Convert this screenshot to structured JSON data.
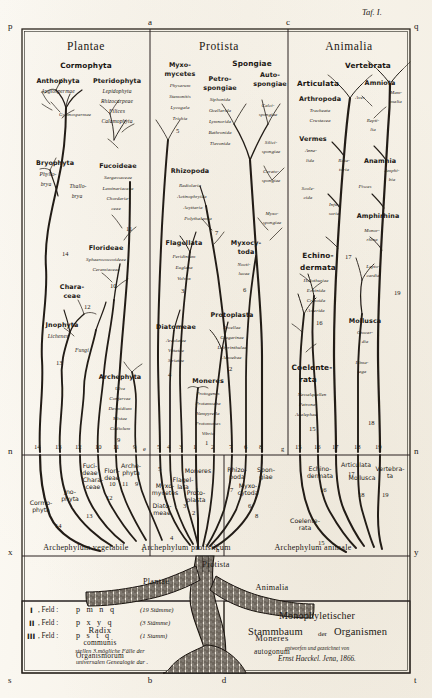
{
  "plate": {
    "taf_label": "Taf. I.",
    "corner_letters": {
      "top_left": "p",
      "top_a": "a",
      "top_c": "c",
      "top_right": "q",
      "mid_left": "n",
      "mid_right": "n",
      "low_left": "x",
      "low_right": "y",
      "bottom_left": "s",
      "bottom_mid": "b",
      "bottom_d": "d",
      "bottom_right": "t",
      "base_e": "e",
      "base_g": "g",
      "base_f": "f",
      "base_h": "h"
    }
  },
  "kingdoms": [
    {
      "name": "Plantae",
      "phylum_line": "Archephylum vegetabile"
    },
    {
      "name": "Protista",
      "phylum_line": "Archephylum protisticum"
    },
    {
      "name": "Animalia",
      "phylum_line": "Archephylum animale"
    }
  ],
  "plantae": {
    "top_header": "Cormophyta",
    "groups": [
      {
        "name": "Anthophyta",
        "subs": [
          "Angiospermae",
          "Gymnospermae"
        ],
        "number": ""
      },
      {
        "name": "Pteridophyta",
        "subs": [
          "Lepidophyta",
          "Rhizocarpeae",
          "Filices",
          "Calamophyta"
        ],
        "number": ""
      },
      {
        "name": "Bryophyta",
        "subs": [
          "Phyllo-",
          "bryа",
          "Thallo-",
          "bryа"
        ],
        "number": "14"
      },
      {
        "name": "Fucoideae",
        "subs": [
          "Sargassaceae",
          "Laminariaceae",
          "Chordaria-",
          "ceae"
        ],
        "number": "11"
      },
      {
        "name": "Florideae",
        "subs": [
          "Sphaerococcoideae",
          "Ceramiaceae"
        ],
        "number": "10"
      },
      {
        "name": "Chara-",
        "name2": "ceae",
        "subs": [],
        "number": "12"
      },
      {
        "name": "Jnophyta",
        "subs": [
          "Lichenes",
          "Fungi"
        ],
        "number": "13"
      },
      {
        "name": "Archephyta",
        "subs": [
          "Ulva",
          "Confervae",
          "Desmidium",
          "Mistae",
          "Codiolum"
        ],
        "number": "9"
      }
    ]
  },
  "protista": {
    "groups": [
      {
        "name": "Myxo-",
        "name2": "mycetes",
        "subs": [
          "Physarum",
          "Stemonitis",
          "Lycogala",
          "Trichia"
        ],
        "number": "5"
      },
      {
        "name": "Spongiae",
        "subs": [],
        "number": ""
      },
      {
        "name": "Petro-",
        "name2": "spongiae",
        "subs": [
          "Siphonida",
          "Ocellarida",
          "Lymnorida",
          "Bathronida",
          "Tlavonida"
        ],
        "number": ""
      },
      {
        "name": "Auto-",
        "name2": "spongiae",
        "subs": [
          "Calci-",
          "spongiae",
          "Silici-",
          "spongiae",
          "Cerato-",
          "spongiae",
          "Myxo-",
          "spongiae"
        ],
        "number": ""
      },
      {
        "name": "Rhizopoda",
        "subs": [
          "Radiolaria",
          "Actinophryida",
          "Acyttaria",
          "Polythalamia"
        ],
        "number": "7"
      },
      {
        "name": "Flagellata",
        "subs": [
          "Peridinium",
          "Euglena",
          "Volvox"
        ],
        "number": "3"
      },
      {
        "name": "Myxocy-",
        "name2": "toda",
        "subs": [
          "Nocti-",
          "lucae"
        ],
        "number": "6"
      },
      {
        "name": "Diatomeae",
        "subs": [
          "Areolatae",
          "Vittatae",
          "Striatae"
        ],
        "number": "4"
      },
      {
        "name": "Protoplasta",
        "subs": [
          "Arcellae",
          "Gregarinae",
          "Labyrinthulae",
          "Amoebae"
        ],
        "number": "2"
      },
      {
        "name": "Moneres",
        "subs": [
          "Protogenes",
          "Protamoeba",
          "Vampyrella",
          "Protomonas",
          "Vibrio"
        ],
        "number": "1"
      }
    ]
  },
  "animalia": {
    "top_header": "Vertebrata",
    "groups": [
      {
        "name": "Articulata",
        "subs": [],
        "number": ""
      },
      {
        "name": "Arthropoda",
        "subs": [
          "Tracheata",
          "Crustacea"
        ],
        "number": ""
      },
      {
        "name": "Vermes",
        "subs": [
          "Anne-",
          "lida"
        ],
        "number": ""
      },
      {
        "name": "Rota-",
        "name2": "toria",
        "subs": [],
        "number": ""
      },
      {
        "name": "Scole-",
        "name2": "cida",
        "subs": [],
        "number": ""
      },
      {
        "name": "Infu-",
        "name2": "soria",
        "subs": [],
        "number": ""
      },
      {
        "name": "Amniota",
        "subs": [
          "Aves",
          "Mam-",
          "malia",
          "Repti-",
          "lia"
        ],
        "number": ""
      },
      {
        "name": "Anamnia",
        "subs": [
          "Amphi-",
          "bia",
          "Pisces"
        ],
        "number": ""
      },
      {
        "name": "Amphirhina",
        "subs": [
          "Monor-",
          "rhina",
          "Lepto-",
          "cardia"
        ],
        "number": "19"
      },
      {
        "name": "Echino-",
        "name2": "dermata",
        "subs": [
          "Holothuriae",
          "Echinida",
          "Crinoida",
          "Asterida"
        ],
        "number": "16"
      },
      {
        "name": "Mollusca",
        "subs": [
          "Otocar-",
          "dia",
          "Hima-",
          "tega"
        ],
        "number": "18"
      },
      {
        "name": "Coelente-",
        "name2": "rata",
        "subs": [
          "Nesselquallen",
          "Petrona-",
          "Acalephae"
        ],
        "number": "15"
      },
      {
        "name": "mark17",
        "subs": [],
        "number": "17"
      }
    ]
  },
  "baseline_numbers": {
    "left": [
      "14",
      "13",
      "12",
      "10",
      "11",
      "9"
    ],
    "mid": [
      "5",
      "3",
      "4",
      "1",
      "2",
      "7",
      "6",
      "8"
    ],
    "right": [
      "15",
      "16",
      "17",
      "18",
      "19"
    ]
  },
  "baseline_names": {
    "plantae": [
      {
        "label": "Cormo-\nphyta",
        "num": "14"
      },
      {
        "label": "Jno-\nphyta",
        "num": "13"
      },
      {
        "label": "Chara-\nceae",
        "num": "12"
      },
      {
        "label": "Flori-\ndeae",
        "num": "10"
      },
      {
        "label": "Fuci-\ndeae",
        "num": "11"
      },
      {
        "label": "Arche-\nphyta",
        "num": "9"
      }
    ],
    "protista": [
      {
        "label": "Diato-\nmeae",
        "num": "4"
      },
      {
        "label": "Flagel-\nlata",
        "num": "3"
      },
      {
        "label": "Myxo-\nmycetes",
        "num": "5"
      },
      {
        "label": "Moneres",
        "num": "1"
      },
      {
        "label": "Proto-\nplasta",
        "num": "2"
      },
      {
        "label": "Rhizo-\npoda",
        "num": "7"
      },
      {
        "label": "Myxo-\ncytoda",
        "num": "6"
      },
      {
        "label": "Spon-\ngiae",
        "num": "8"
      }
    ],
    "animalia": [
      {
        "label": "Coelente-\nrata",
        "num": "15"
      },
      {
        "label": "Echino-\ndermata",
        "num": "16"
      },
      {
        "label": "Articulata",
        "num": "17"
      },
      {
        "label": "Mollusca",
        "num": "18"
      },
      {
        "label": "Vertebra-\nta",
        "num": "19"
      }
    ]
  },
  "root": {
    "plantae_label": "Plantae",
    "protista_label": "Protista",
    "animalia_label": "Animalia",
    "radix_line1": "Radix",
    "radix_line2": "communis",
    "radix_line3": "Organismorum",
    "moneres_line1": "Moneres",
    "moneres_line2": "autogonum"
  },
  "legend": {
    "rows": [
      {
        "roman": "I",
        "feld": ", Feld :",
        "letters": "p m n q",
        "note": "(19 Stämme)"
      },
      {
        "roman": "II",
        "feld": ", Feld :",
        "letters": "p x y q",
        "note": "(3 Stämme)"
      },
      {
        "roman": "III",
        "feld": ", Feld :",
        "letters": "p s t q",
        "note": "(1 Stamm)"
      }
    ],
    "footer1": "stellen 3 mögliche Fälle der",
    "footer2": "universalen Genealogie dar ."
  },
  "title_block": {
    "line1": "Monophyletischer",
    "line2a": "Stammbaum",
    "line2b": "der",
    "line2c": "Organismen",
    "line3": "entworfen und gezeichnet von",
    "line4": "Ernst Haeckel. Jena, 1866."
  },
  "colors": {
    "ink": "#1b1713",
    "paper": "#fbf9f4",
    "trunk": "#2a231c"
  }
}
